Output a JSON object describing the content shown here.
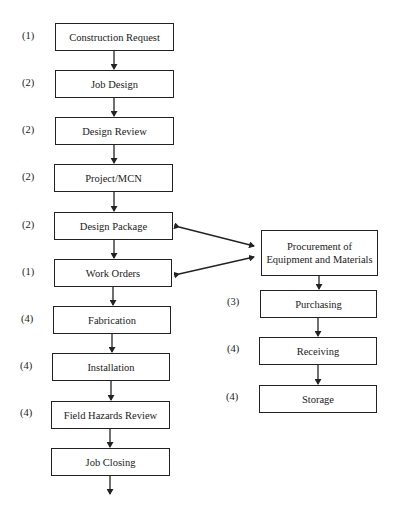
{
  "diagram": {
    "main_flow": [
      {
        "step": "(1)",
        "label": "Construction Request"
      },
      {
        "step": "(2)",
        "label": "Job Design"
      },
      {
        "step": "(2)",
        "label": "Design Review"
      },
      {
        "step": "(2)",
        "label": "Project/MCN"
      },
      {
        "step": "(2)",
        "label": "Design Package"
      },
      {
        "step": "(1)",
        "label": "Work Orders"
      },
      {
        "step": "(4)",
        "label": "Fabrication"
      },
      {
        "step": "(4)",
        "label": "Installation"
      },
      {
        "step": "(4)",
        "label": "Field Hazards Review"
      },
      {
        "step": "",
        "label": "Job Closing"
      }
    ],
    "procurement": {
      "label_line1": "Procurement of",
      "label_line2": "Equipment and Materials"
    },
    "procurement_flow": [
      {
        "step": "(3)",
        "label": "Purchasing"
      },
      {
        "step": "(4)",
        "label": "Receiving"
      },
      {
        "step": "(4)",
        "label": "Storage"
      }
    ],
    "line_color": "#222222"
  }
}
